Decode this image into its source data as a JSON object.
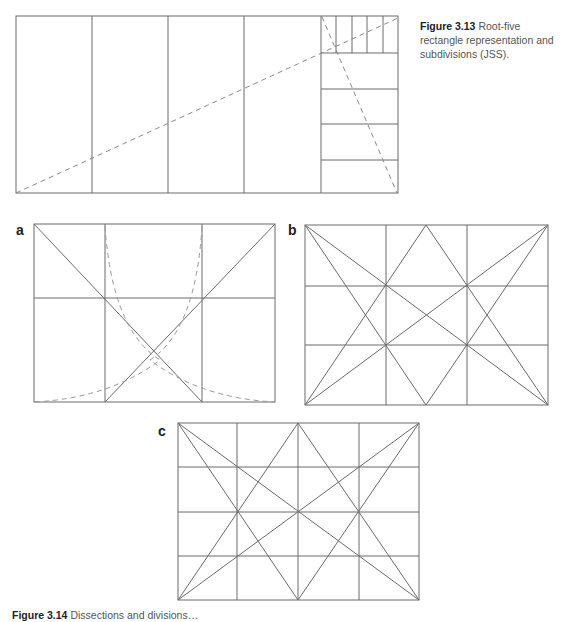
{
  "figure_3_13": {
    "number": "Figure 3.13",
    "caption": "Root-five rectangle representation and subdivisions (JSS)."
  },
  "figure_3_14": {
    "number": "Figure 3.14",
    "caption": "Dissections and divisions…",
    "panels": [
      {
        "label": "a"
      },
      {
        "label": "b"
      },
      {
        "label": "c"
      }
    ]
  },
  "colors": {
    "line": "#6a6a6a",
    "dashed": "#8a8a8a"
  }
}
